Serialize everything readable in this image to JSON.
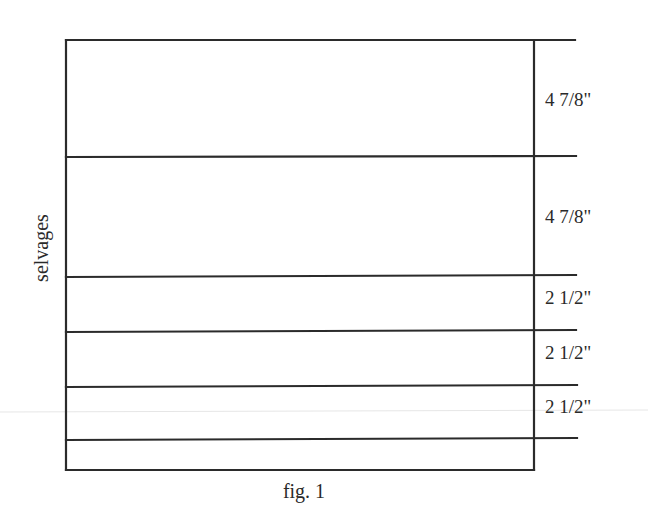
{
  "diagram": {
    "type": "fabric-cutting-diagram",
    "side_label": "selvages",
    "caption": "fig. 1",
    "strips": [
      {
        "label": "4 7/8\""
      },
      {
        "label": "4 7/8\""
      },
      {
        "label": "2 1/2\""
      },
      {
        "label": "2 1/2\""
      },
      {
        "label": "2 1/2\""
      }
    ],
    "remainder_strip": {
      "label": ""
    }
  }
}
